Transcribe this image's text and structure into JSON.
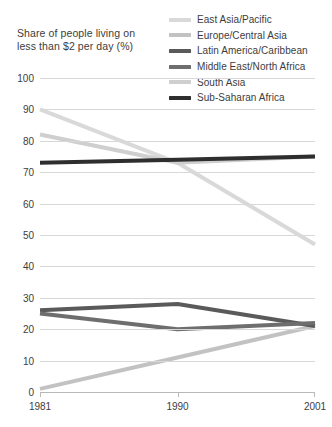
{
  "title": {
    "line1": "Share of people living on",
    "line2": "less than $2 per day (%)"
  },
  "legend": {
    "position": "top-right",
    "items": [
      {
        "label": "East Asia/Pacific",
        "color": "#d9d9d9"
      },
      {
        "label": "Europe/Central Asia",
        "color": "#c2c2c2"
      },
      {
        "label": "Latin America/Caribbean",
        "color": "#5a5a5a"
      },
      {
        "label": "Middle East/North Africa",
        "color": "#6e6e6e"
      },
      {
        "label": "South Asia",
        "color": "#cfcfcf"
      },
      {
        "label": "Sub-Saharan Africa",
        "color": "#2e2e2e"
      }
    ]
  },
  "axes": {
    "y_ticks": [
      "100",
      "90",
      "80",
      "70",
      "60",
      "50",
      "40",
      "30",
      "20",
      "10",
      "0"
    ],
    "x_ticks": [
      "1981",
      "1990",
      "2001"
    ]
  },
  "chart_data": {
    "type": "line",
    "title": "Share of people living on less than $2 per day (%)",
    "xlabel": "",
    "ylabel": "Share of people living on less than $2 per day (%)",
    "x": [
      1981,
      1990,
      2001
    ],
    "categories": [
      "1981",
      "1990",
      "2001"
    ],
    "ylim": [
      0,
      100
    ],
    "xlim": [
      1981,
      2001
    ],
    "yticks": [
      0,
      10,
      20,
      30,
      40,
      50,
      60,
      70,
      80,
      90,
      100
    ],
    "grid": true,
    "legend_position": "top-right",
    "series": [
      {
        "name": "East Asia/Pacific",
        "color": "#d9d9d9",
        "values": [
          90,
          73,
          47
        ]
      },
      {
        "name": "Europe/Central Asia",
        "color": "#c2c2c2",
        "values": [
          1,
          11,
          21
        ]
      },
      {
        "name": "Latin America/Caribbean",
        "color": "#5a5a5a",
        "values": [
          26,
          28,
          21
        ]
      },
      {
        "name": "Middle East/North Africa",
        "color": "#6e6e6e",
        "values": [
          25,
          20,
          22
        ]
      },
      {
        "name": "South Asia",
        "color": "#cfcfcf",
        "values": [
          82,
          73,
          75
        ]
      },
      {
        "name": "Sub-Saharan Africa",
        "color": "#2e2e2e",
        "values": [
          73,
          74,
          75
        ]
      }
    ]
  }
}
